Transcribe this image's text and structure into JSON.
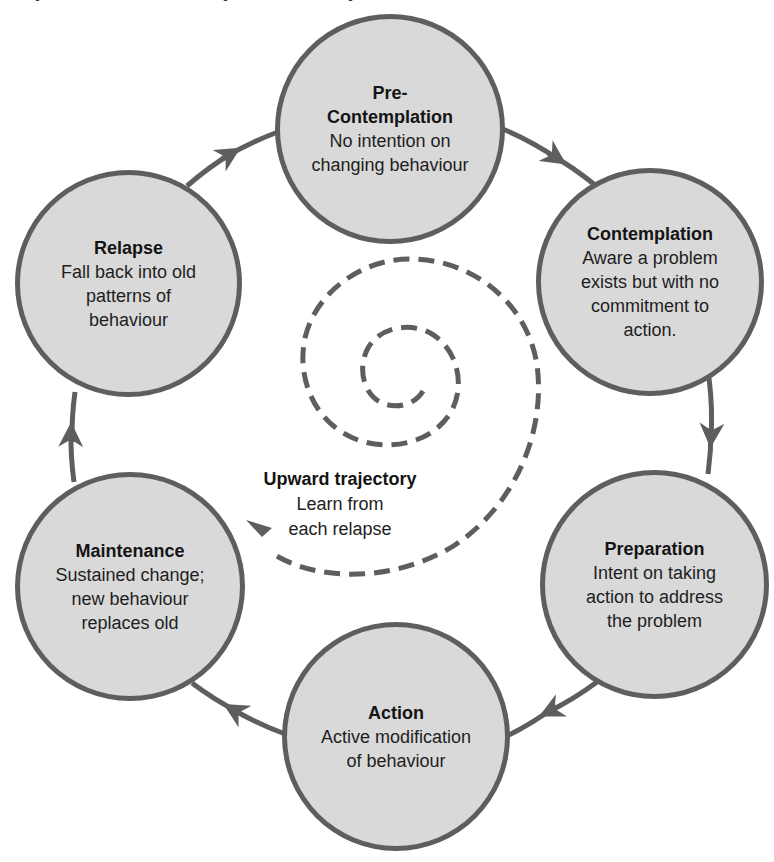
{
  "colors": {
    "stage_fill": "#d9d9d9",
    "stage_stroke": "#5e5e5e",
    "arrow_stroke": "#5e5e5e",
    "text": "#1a1a1a"
  },
  "stages": [
    {
      "id": "pre-contemplation",
      "title": "Pre-\nContemplation",
      "title_lines": [
        "Pre-",
        "Contemplation"
      ],
      "desc_lines": [
        "No intention on",
        "changing behaviour"
      ]
    },
    {
      "id": "contemplation",
      "title_lines": [
        "Contemplation"
      ],
      "desc_lines": [
        "Aware a problem",
        "exists but with no",
        "commitment to",
        "action."
      ]
    },
    {
      "id": "preparation",
      "title_lines": [
        "Preparation"
      ],
      "desc_lines": [
        "Intent on taking",
        "action to address",
        "the problem"
      ]
    },
    {
      "id": "action",
      "title_lines": [
        "Action"
      ],
      "desc_lines": [
        "Active modification",
        "of behaviour"
      ]
    },
    {
      "id": "maintenance",
      "title_lines": [
        "Maintenance"
      ],
      "desc_lines": [
        "Sustained change;",
        "new behaviour",
        "replaces old"
      ]
    },
    {
      "id": "relapse",
      "title_lines": [
        "Relapse"
      ],
      "desc_lines": [
        "Fall back into old",
        "patterns of",
        "behaviour"
      ]
    }
  ],
  "center": {
    "title": "Upward trajectory",
    "desc_lines": [
      "Learn from",
      "each relapse"
    ]
  },
  "cycle_arrows": [
    {
      "from": "pre-contemplation",
      "to": "contemplation"
    },
    {
      "from": "contemplation",
      "to": "preparation"
    },
    {
      "from": "preparation",
      "to": "action"
    },
    {
      "from": "action",
      "to": "maintenance"
    },
    {
      "from": "maintenance",
      "to": "relapse"
    },
    {
      "from": "relapse",
      "to": "pre-contemplation"
    }
  ]
}
